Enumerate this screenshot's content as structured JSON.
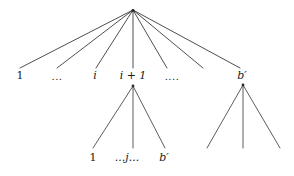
{
  "diagram": {
    "type": "tree",
    "title": "",
    "background_color": "#ffffff",
    "edge_color": "#3a3a3a",
    "label_color": "#1a1a1a",
    "nodes": {
      "root": {
        "x": 133,
        "y": 10,
        "label": ""
      },
      "child_1": {
        "x": 20,
        "y": 75,
        "label": "1"
      },
      "child_dots_1": {
        "x": 57,
        "y": 75,
        "label": "..."
      },
      "child_i": {
        "x": 95,
        "y": 75,
        "label": "i"
      },
      "child_i_plus_1": {
        "x": 133,
        "y": 75,
        "label": "i + 1"
      },
      "child_dots_2": {
        "x": 172,
        "y": 75,
        "label": "...."
      },
      "child_b_prime": {
        "x": 242,
        "y": 75,
        "label": "b′"
      },
      "mid_sub_leaf_1": {
        "x": 93,
        "y": 157,
        "label": "1"
      },
      "mid_sub_leaf_j": {
        "x": 127,
        "y": 157,
        "label": "...j..."
      },
      "mid_sub_leaf_b": {
        "x": 164,
        "y": 157,
        "label": "b′"
      }
    },
    "root_fan": {
      "apex_x": 133,
      "apex_y": 10,
      "end_y": 68,
      "end_xs": [
        20,
        57,
        96,
        133,
        167,
        203,
        240
      ]
    },
    "middle_subtree": {
      "apex_x": 133,
      "apex_y": 86,
      "end_y": 148,
      "end_xs": [
        93,
        133,
        165
      ]
    },
    "right_subtree": {
      "apex_x": 243,
      "apex_y": 85,
      "end_y": 148,
      "end_xs": [
        207,
        243,
        280
      ]
    }
  }
}
